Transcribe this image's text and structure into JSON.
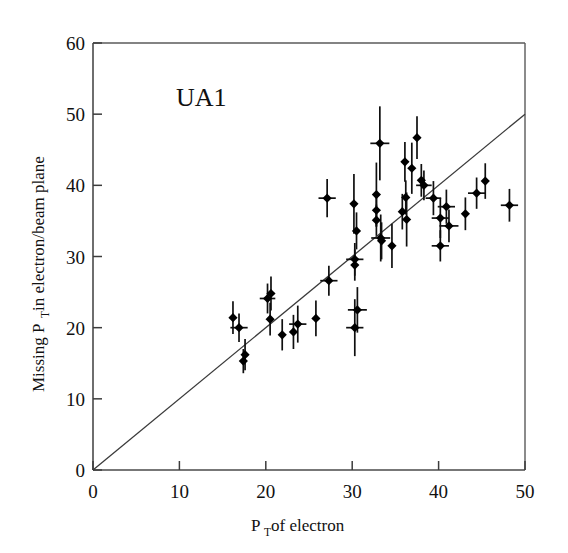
{
  "figure": {
    "annotation": "UA1",
    "background_color": "#ffffff",
    "marker_color": "#000000",
    "axis_color": "#3c3c3c",
    "fitline_color": "#3a3a3a"
  },
  "chart_data": {
    "type": "scatter",
    "title": "",
    "annotation": "UA1",
    "xlabel_main": "P",
    "xlabel_sub": "T",
    "xlabel_rest": " of electron",
    "xlabel": "P_T of electron",
    "ylabel_main": "Missing P",
    "ylabel_sub": "T",
    "ylabel_rest": " in electron/beam plane",
    "ylabel": "Missing P_T in electron/beam plane",
    "xlim": [
      0,
      50
    ],
    "ylim": [
      0,
      60
    ],
    "xticks": [
      0,
      10,
      20,
      30,
      40,
      50
    ],
    "yticks": [
      0,
      10,
      20,
      30,
      40,
      50,
      60
    ],
    "xtick_labels": [
      "0",
      "10",
      "20",
      "30",
      "40",
      "50"
    ],
    "ytick_labels": [
      "0",
      "10",
      "20",
      "30",
      "40",
      "50",
      "60"
    ],
    "grid": false,
    "legend": null,
    "reference_line": {
      "label": "y = x",
      "x": [
        0,
        50
      ],
      "y": [
        0,
        50
      ]
    },
    "error_bars": "vertical and horizontal (1 sigma)",
    "points": [
      {
        "x": 16.2,
        "y": 21.4,
        "yerr": 2.3,
        "xerr": 0.0
      },
      {
        "x": 16.9,
        "y": 20.0,
        "yerr": 2.0,
        "xerr": 1.0
      },
      {
        "x": 17.6,
        "y": 16.2,
        "yerr": 2.2,
        "xerr": 0.0
      },
      {
        "x": 17.4,
        "y": 15.3,
        "yerr": 1.7,
        "xerr": 0.0
      },
      {
        "x": 20.2,
        "y": 24.1,
        "yerr": 2.1,
        "xerr": 0.9
      },
      {
        "x": 20.6,
        "y": 24.8,
        "yerr": 2.4,
        "xerr": 0.0
      },
      {
        "x": 20.5,
        "y": 21.2,
        "yerr": 2.3,
        "xerr": 0.0
      },
      {
        "x": 21.9,
        "y": 19.0,
        "yerr": 2.2,
        "xerr": 0.0
      },
      {
        "x": 23.2,
        "y": 19.4,
        "yerr": 2.4,
        "xerr": 0.0
      },
      {
        "x": 23.7,
        "y": 20.5,
        "yerr": 2.6,
        "xerr": 1.0
      },
      {
        "x": 25.8,
        "y": 21.3,
        "yerr": 2.5,
        "xerr": 0.0
      },
      {
        "x": 27.3,
        "y": 26.6,
        "yerr": 2.1,
        "xerr": 1.0
      },
      {
        "x": 27.1,
        "y": 38.2,
        "yerr": 2.7,
        "xerr": 1.0
      },
      {
        "x": 30.3,
        "y": 29.6,
        "yerr": 2.3,
        "xerr": 1.0
      },
      {
        "x": 30.3,
        "y": 28.8,
        "yerr": 2.2,
        "xerr": 0.0
      },
      {
        "x": 30.2,
        "y": 37.4,
        "yerr": 4.2,
        "xerr": 0.0
      },
      {
        "x": 30.5,
        "y": 33.6,
        "yerr": 2.6,
        "xerr": 0.0
      },
      {
        "x": 30.6,
        "y": 22.5,
        "yerr": 3.2,
        "xerr": 1.1
      },
      {
        "x": 30.3,
        "y": 20.0,
        "yerr": 4.0,
        "xerr": 1.0
      },
      {
        "x": 32.8,
        "y": 38.7,
        "yerr": 4.5,
        "xerr": 0.0
      },
      {
        "x": 32.8,
        "y": 36.5,
        "yerr": 2.3,
        "xerr": 0.0
      },
      {
        "x": 32.8,
        "y": 35.1,
        "yerr": 2.2,
        "xerr": 0.0
      },
      {
        "x": 33.2,
        "y": 45.9,
        "yerr": 5.2,
        "xerr": 1.1
      },
      {
        "x": 33.3,
        "y": 32.6,
        "yerr": 3.3,
        "xerr": 1.1
      },
      {
        "x": 33.4,
        "y": 32.2,
        "yerr": 2.6,
        "xerr": 0.0
      },
      {
        "x": 34.6,
        "y": 31.5,
        "yerr": 3.1,
        "xerr": 0.0
      },
      {
        "x": 35.8,
        "y": 36.3,
        "yerr": 2.5,
        "xerr": 0.0
      },
      {
        "x": 36.2,
        "y": 38.3,
        "yerr": 2.4,
        "xerr": 0.0
      },
      {
        "x": 36.1,
        "y": 43.3,
        "yerr": 2.8,
        "xerr": 0.0
      },
      {
        "x": 36.3,
        "y": 35.2,
        "yerr": 3.8,
        "xerr": 0.0
      },
      {
        "x": 36.9,
        "y": 42.4,
        "yerr": 3.6,
        "xerr": 0.0
      },
      {
        "x": 37.5,
        "y": 46.7,
        "yerr": 3.0,
        "xerr": 0.0
      },
      {
        "x": 38.0,
        "y": 40.7,
        "yerr": 2.3,
        "xerr": 0.0
      },
      {
        "x": 38.3,
        "y": 40.0,
        "yerr": 2.1,
        "xerr": 0.9
      },
      {
        "x": 39.4,
        "y": 38.2,
        "yerr": 2.4,
        "xerr": 0.9
      },
      {
        "x": 40.2,
        "y": 35.4,
        "yerr": 2.8,
        "xerr": 1.0
      },
      {
        "x": 40.2,
        "y": 31.5,
        "yerr": 2.2,
        "xerr": 1.0
      },
      {
        "x": 40.9,
        "y": 37.0,
        "yerr": 2.4,
        "xerr": 1.0
      },
      {
        "x": 41.2,
        "y": 34.3,
        "yerr": 2.3,
        "xerr": 1.1
      },
      {
        "x": 43.1,
        "y": 36.0,
        "yerr": 2.3,
        "xerr": 0.0
      },
      {
        "x": 44.4,
        "y": 38.9,
        "yerr": 2.2,
        "xerr": 1.0
      },
      {
        "x": 45.4,
        "y": 40.6,
        "yerr": 2.5,
        "xerr": 0.0
      },
      {
        "x": 48.2,
        "y": 37.2,
        "yerr": 2.3,
        "xerr": 1.0
      }
    ]
  }
}
